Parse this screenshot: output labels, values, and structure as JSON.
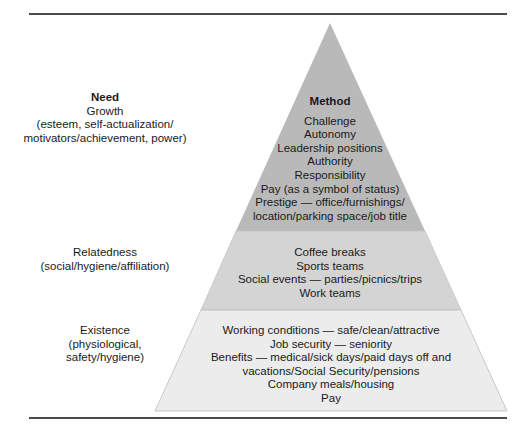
{
  "left_column": {
    "header": "Need",
    "tiers": [
      {
        "name": "Growth",
        "detail_lines": [
          "(esteem, self-actualization/",
          "motivators/achievement, power)"
        ]
      },
      {
        "name": "Relatedness",
        "detail_lines": [
          "(social/hygiene/affiliation)"
        ]
      },
      {
        "name": "Existence",
        "detail_lines": [
          "(physiological,",
          "safety/hygiene)"
        ]
      }
    ]
  },
  "pyramid": {
    "header": "Method",
    "tiers": [
      {
        "level": "top",
        "fill": "#b9b9b9",
        "lines": [
          "Challenge",
          "Autonomy",
          "Leadership positions",
          "Authority",
          "Responsibility",
          "Pay (as a symbol of status)",
          "Prestige — office/furnishings/",
          "location/parking space/job title"
        ]
      },
      {
        "level": "middle",
        "fill": "#d4d4d4",
        "lines": [
          "Coffee breaks",
          "Sports teams",
          "Social events — parties/picnics/trips",
          "Work teams"
        ]
      },
      {
        "level": "bottom",
        "fill": "#ececec",
        "lines": [
          "Working conditions — safe/clean/attractive",
          "Job security — seniority",
          "Benefits — medical/sick days/paid days off and",
          "vacations/Social Security/pensions",
          "Company meals/housing",
          "Pay"
        ]
      }
    ]
  }
}
